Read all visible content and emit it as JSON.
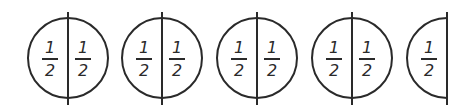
{
  "diagram": {
    "title": "",
    "colors": {
      "stroke": "#2a2a2a",
      "background": "#ffffff"
    },
    "shapes": [
      {
        "type": "circle",
        "cx": 68,
        "halves": [
          {
            "num": "1",
            "den": "2"
          },
          {
            "num": "1",
            "den": "2"
          }
        ]
      },
      {
        "type": "circle",
        "cx": 162,
        "halves": [
          {
            "num": "1",
            "den": "2"
          },
          {
            "num": "1",
            "den": "2"
          }
        ]
      },
      {
        "type": "circle",
        "cx": 257,
        "halves": [
          {
            "num": "1",
            "den": "2"
          },
          {
            "num": "1",
            "den": "2"
          }
        ]
      },
      {
        "type": "circle",
        "cx": 352,
        "halves": [
          {
            "num": "1",
            "den": "2"
          },
          {
            "num": "1",
            "den": "2"
          }
        ]
      },
      {
        "type": "half-circle",
        "cx": 447,
        "halves": [
          {
            "num": "1",
            "den": "2"
          }
        ]
      }
    ]
  }
}
